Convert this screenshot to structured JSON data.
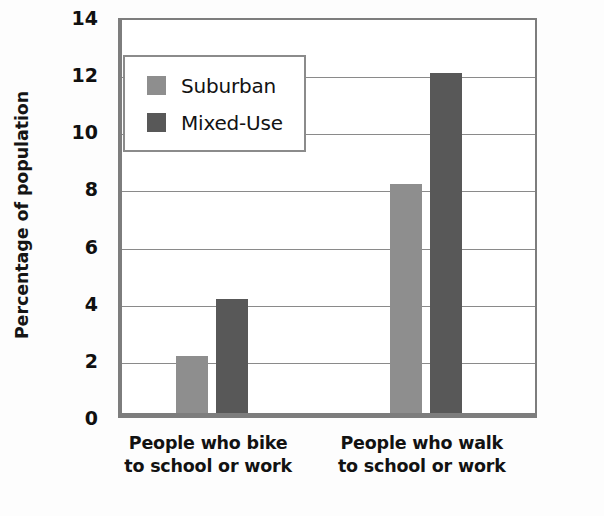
{
  "chart_data": {
    "type": "bar",
    "title": "",
    "xlabel": "",
    "ylabel": "Percentage of population",
    "ylim": [
      0,
      14
    ],
    "ytick_step": 2,
    "ytick_labels": [
      "0",
      "2",
      "4",
      "6",
      "8",
      "10",
      "12",
      "14"
    ],
    "grid": true,
    "legend_position": "upper-left-inside",
    "categories": [
      "People who bike\nto school or work",
      "People who walk\nto school or work"
    ],
    "category_lines": [
      [
        "People who bike",
        "to school or work"
      ],
      [
        "People who walk",
        "to school or work"
      ]
    ],
    "series": [
      {
        "name": "Suburban",
        "color": "#8e8e8e",
        "values": [
          2,
          8
        ]
      },
      {
        "name": "Mixed-Use",
        "color": "#585858",
        "values": [
          4,
          11.9
        ]
      }
    ]
  },
  "legend": {
    "items": [
      {
        "label": "Suburban",
        "color": "#8e8e8e"
      },
      {
        "label": "Mixed-Use",
        "color": "#585858"
      }
    ]
  },
  "axes": {
    "y_title": "Percentage of population",
    "axis_color": "#7d7d7d",
    "gridline_color": "#8a8a8a"
  }
}
